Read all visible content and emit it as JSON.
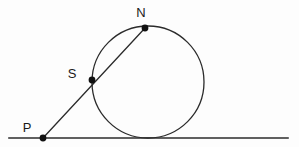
{
  "figure": {
    "background_color": "#fdfdfd",
    "stroke_color": "#2b2b2b",
    "point_color": "#111111",
    "label_color": "#1a1a1a",
    "width": 299,
    "height": 147
  },
  "labels": {
    "point_n": "N",
    "point_s": "S",
    "point_p": "P"
  },
  "chart_data": {
    "type": "scatter",
    "xlabel": "",
    "ylabel": "",
    "xlim": [
      0,
      299
    ],
    "ylim": [
      147,
      0
    ],
    "grid": false,
    "legend": "none",
    "points": [
      {
        "name": "N",
        "label": "N",
        "x": 145,
        "y": 28,
        "label_x": 141,
        "label_y": 17
      },
      {
        "name": "S",
        "label": "S",
        "x": 92,
        "y": 80,
        "label_x": 72,
        "label_y": 78
      },
      {
        "name": "P",
        "label": "P",
        "x": 43,
        "y": 138,
        "label_x": 27,
        "label_y": 132
      }
    ],
    "shapes": [
      {
        "name": "circle",
        "type": "circle",
        "cx": 148,
        "cy": 82,
        "r": 56,
        "fill": "none"
      },
      {
        "name": "tangent-line",
        "type": "line",
        "x1": 9,
        "y1": 138,
        "x2": 288,
        "y2": 138
      },
      {
        "name": "secant-line",
        "type": "line",
        "x1": 43,
        "y1": 138,
        "x2": 145,
        "y2": 28
      }
    ],
    "tangent_point": {
      "x": 148,
      "y": 138
    }
  }
}
